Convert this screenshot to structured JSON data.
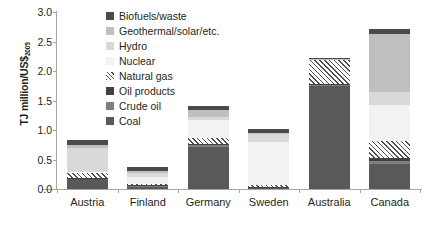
{
  "chart_data": {
    "type": "bar",
    "stacked": true,
    "title": "",
    "xlabel": "",
    "ylabel": "TJ million/US$2005",
    "ylabel_main": "TJ million/US$",
    "ylabel_sub": "2005",
    "ylim": [
      0,
      3.0
    ],
    "ystep": 0.5,
    "ytick_labels": [
      "0.0",
      "0.5",
      "1.0",
      "1.5",
      "2.0",
      "2.5",
      "3.0"
    ],
    "ytick_values": [
      0,
      0.5,
      1.0,
      1.5,
      2.0,
      2.5,
      3.0
    ],
    "grid": false,
    "legend_position": "inside-top-left",
    "categories": [
      "Austria",
      "Finland",
      "Germany",
      "Sweden",
      "Australia",
      "Canada"
    ],
    "series": [
      {
        "name": "Coal",
        "color": "#595959",
        "pattern": "solid",
        "values": [
          0.17,
          0.04,
          0.72,
          0.02,
          1.74,
          0.42
        ]
      },
      {
        "name": "Crude oil",
        "color": "#7f7f7f",
        "pattern": "solid",
        "values": [
          0.01,
          0.01,
          0.03,
          0.01,
          0.02,
          0.06
        ]
      },
      {
        "name": "Oil products",
        "color": "#404040",
        "pattern": "solid",
        "values": [
          0.01,
          0.01,
          0.02,
          0.01,
          0.02,
          0.04
        ]
      },
      {
        "name": "Natural gas",
        "color": "#ffffff",
        "pattern": "diagonal-hatch",
        "values": [
          0.09,
          0.02,
          0.1,
          0.02,
          0.42,
          0.29
        ]
      },
      {
        "name": "Nuclear",
        "color": "#f2f2f2",
        "pattern": "solid",
        "values": [
          0.0,
          0.12,
          0.3,
          0.73,
          0.0,
          0.62
        ]
      },
      {
        "name": "Hydro",
        "color": "#d9d9d9",
        "pattern": "solid",
        "values": [
          0.42,
          0.07,
          0.05,
          0.14,
          0.0,
          0.21
        ]
      },
      {
        "name": "Geothermal/solar/etc.",
        "color": "#bfbfbf",
        "pattern": "solid",
        "values": [
          0.05,
          0.04,
          0.12,
          0.02,
          0.01,
          0.99
        ]
      },
      {
        "name": "Biofuels/waste",
        "color": "#4a4a4a",
        "pattern": "solid",
        "values": [
          0.08,
          0.06,
          0.06,
          0.06,
          0.01,
          0.08
        ]
      }
    ],
    "totals": [
      0.83,
      0.37,
      1.4,
      1.01,
      2.22,
      2.71
    ]
  },
  "legend": {
    "items": [
      {
        "label": "Biofuels/waste",
        "color": "#4a4a4a",
        "pattern": "solid"
      },
      {
        "label": "Geothermal/solar/etc.",
        "color": "#bfbfbf",
        "pattern": "solid"
      },
      {
        "label": "Hydro",
        "color": "#d9d9d9",
        "pattern": "solid"
      },
      {
        "label": "Nuclear",
        "color": "#f2f2f2",
        "pattern": "solid"
      },
      {
        "label": "Natural gas",
        "color": "#ffffff",
        "pattern": "diagonal-hatch"
      },
      {
        "label": "Oil products",
        "color": "#404040",
        "pattern": "solid"
      },
      {
        "label": "Crude oil",
        "color": "#7f7f7f",
        "pattern": "solid"
      },
      {
        "label": "Coal",
        "color": "#595959",
        "pattern": "solid"
      }
    ]
  }
}
